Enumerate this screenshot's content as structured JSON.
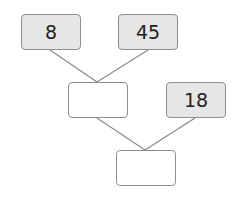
{
  "diagram": {
    "type": "number-tree",
    "boxes": [
      {
        "id": "top-left",
        "value": "8",
        "filled": true
      },
      {
        "id": "top-right",
        "value": "45",
        "filled": true
      },
      {
        "id": "middle-left",
        "value": "",
        "filled": false
      },
      {
        "id": "middle-right",
        "value": "18",
        "filled": true
      },
      {
        "id": "bottom",
        "value": "",
        "filled": false
      }
    ],
    "connections": [
      [
        "top-left",
        "middle-left"
      ],
      [
        "top-right",
        "middle-left"
      ],
      [
        "middle-left",
        "bottom"
      ],
      [
        "middle-right",
        "bottom"
      ]
    ],
    "colors": {
      "fill": "#e6e6e6",
      "border": "#8f8f8f",
      "line": "#8a8a8a"
    }
  }
}
